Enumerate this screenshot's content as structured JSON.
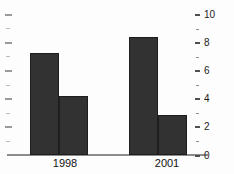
{
  "chart_data": {
    "type": "bar",
    "categories": [
      "1998",
      "2001"
    ],
    "series": [
      {
        "name": "bar-1",
        "values": [
          7.3,
          8.4
        ]
      },
      {
        "name": "bar-2",
        "values": [
          4.2,
          2.9
        ]
      }
    ],
    "title": "",
    "xlabel": "",
    "ylabel": "",
    "ylim": [
      0,
      10
    ],
    "y_axis_side": "right",
    "y_major_ticks": [
      0,
      2,
      4,
      6,
      8,
      10
    ],
    "y_minor_ticks": [
      1,
      3,
      5,
      7,
      9
    ],
    "left_edge_ticks": [
      1,
      2,
      3,
      4,
      5,
      6,
      7,
      8,
      9,
      10
    ],
    "grid": false,
    "legend": "none",
    "colors": {
      "bar_fill": "#323232",
      "bar_border": "#1e1e1e",
      "axis_line": "#8c8c8c",
      "major_tick": "#4f4f4f",
      "minor_tick": "#8a8a8a",
      "label_text": "#1a1a1a",
      "background": "#fdfdfd"
    }
  }
}
